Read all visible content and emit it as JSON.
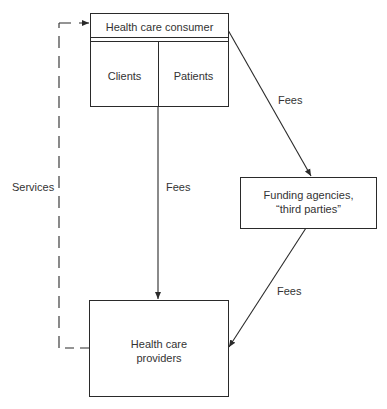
{
  "diagram": {
    "nodes": {
      "consumer": {
        "title": "Health care consumer",
        "sub_left": "Clients",
        "sub_right": "Patients"
      },
      "funding": {
        "line1": "Funding agencies,",
        "line2": "“third parties”"
      },
      "providers": {
        "line1": "Health care",
        "line2": "providers"
      }
    },
    "edges": {
      "consumer_to_funding": "Fees",
      "consumer_to_providers": "Fees",
      "funding_to_providers": "Fees",
      "providers_to_consumer": "Services"
    },
    "colors": {
      "line": "#2a2a2a",
      "text": "#333333",
      "background": "#ffffff"
    }
  }
}
